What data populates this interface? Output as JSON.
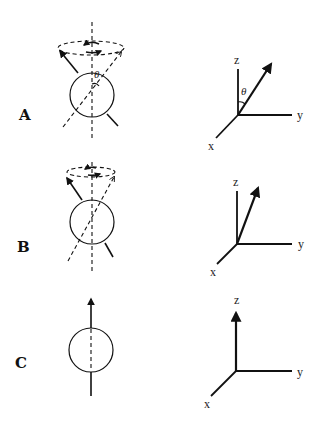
{
  "figure": {
    "type": "diagram",
    "colors": {
      "ink": "#111111",
      "background": "#ffffff"
    },
    "panels": [
      {
        "label": "A",
        "angle_symbol": "θ",
        "tilt": "large",
        "axes": {
          "x": "x",
          "y": "y",
          "z": "z"
        },
        "precession": true
      },
      {
        "label": "B",
        "tilt": "medium",
        "axes": {
          "x": "x",
          "y": "y",
          "z": "z"
        },
        "precession": true
      },
      {
        "label": "C",
        "tilt": "none",
        "axes": {
          "x": "x",
          "y": "y",
          "z": "z"
        },
        "precession": false
      }
    ]
  }
}
